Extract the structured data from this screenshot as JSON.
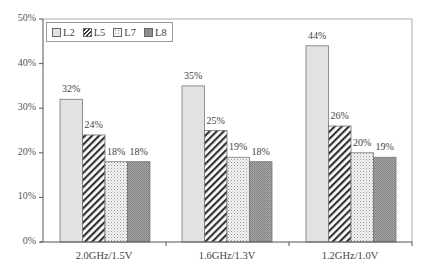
{
  "chart_data": {
    "type": "bar",
    "title": "",
    "xlabel": "",
    "ylabel": "",
    "categories": [
      "2.0GHz/1.5V",
      "1.6GHz/1.3V",
      "1.2GHz/1.0V"
    ],
    "series": [
      {
        "name": "L2",
        "values": [
          32,
          35,
          44
        ],
        "labels": [
          "32%",
          "35%",
          "44%"
        ],
        "pattern": "light-gray-solid"
      },
      {
        "name": "L5",
        "values": [
          24,
          25,
          26
        ],
        "labels": [
          "24%",
          "25%",
          "26%"
        ],
        "pattern": "diagonal-hatch"
      },
      {
        "name": "L7",
        "values": [
          18,
          19,
          20
        ],
        "labels": [
          "18%",
          "19%",
          "20%"
        ],
        "pattern": "dotted"
      },
      {
        "name": "L8",
        "values": [
          18,
          18,
          19
        ],
        "labels": [
          "18%",
          "18%",
          "19%"
        ],
        "pattern": "dark-gray-dense"
      }
    ],
    "yticks": [
      "0%",
      "10%",
      "20%",
      "30%",
      "40%",
      "50%"
    ],
    "ylim": [
      0,
      50
    ],
    "grid": false,
    "legend_position": "top-left inside"
  },
  "legend": {
    "items": [
      "L2",
      "L5",
      "L7",
      "L8"
    ]
  },
  "colors": {
    "L2": "#e2e2e2",
    "L5": "#ffffff",
    "L7": "#f2f2f2",
    "L8": "#9a9a9a",
    "axis": "#555555",
    "frame": "#aaaaaa"
  }
}
